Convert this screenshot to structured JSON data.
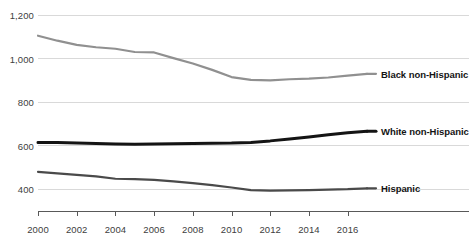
{
  "chart_data": {
    "type": "line",
    "title": "",
    "subtitle": "",
    "xlabel": "",
    "ylabel": "",
    "x": [
      2000,
      2001,
      2002,
      2003,
      2004,
      2005,
      2006,
      2007,
      2008,
      2009,
      2010,
      2011,
      2012,
      2013,
      2014,
      2015,
      2016,
      2017
    ],
    "xlim": [
      2000,
      2017
    ],
    "ylim": [
      300,
      1200
    ],
    "grid": "horizontal",
    "legend_position": "right-inline-end-of-line",
    "series": [
      {
        "name": "Black non-Hispanic",
        "color": "#909090",
        "width": 2.2,
        "values": [
          1105,
          1082,
          1063,
          1052,
          1045,
          1030,
          1028,
          1002,
          977,
          948,
          915,
          902,
          900,
          905,
          908,
          913,
          922,
          930
        ]
      },
      {
        "name": "White non-Hispanic",
        "color": "#141414",
        "width": 3.0,
        "values": [
          615,
          614,
          612,
          610,
          608,
          607,
          608,
          609,
          610,
          611,
          612,
          615,
          622,
          631,
          640,
          650,
          659,
          666
        ]
      },
      {
        "name": "Hispanic",
        "color": "#4a4a4a",
        "width": 2.2,
        "values": [
          480,
          473,
          466,
          459,
          448,
          446,
          443,
          436,
          428,
          419,
          408,
          396,
          394,
          395,
          396,
          398,
          400,
          404
        ]
      }
    ],
    "y_ticks": [
      400,
      600,
      800,
      1000,
      1200
    ],
    "y_tick_labels": [
      "400",
      "600",
      "800",
      "1,000",
      "1,200"
    ],
    "x_ticks": [
      2000,
      2002,
      2004,
      2006,
      2008,
      2010,
      2012,
      2014,
      2016
    ],
    "x_tick_labels": [
      "2000",
      "2002",
      "2004",
      "2006",
      "2008",
      "2010",
      "2012",
      "2014",
      "2016"
    ],
    "colors": {
      "gridline": "#d9d9d9",
      "axis": "#595959",
      "text": "#404040",
      "label_text": "#141414",
      "background": "#ffffff"
    }
  }
}
